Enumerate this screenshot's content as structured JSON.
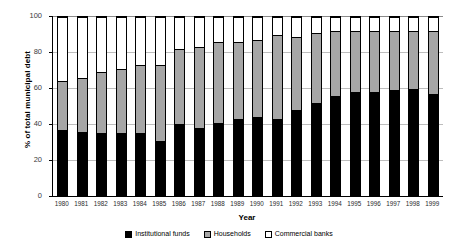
{
  "chart_data": {
    "type": "bar",
    "stacked": true,
    "title": "",
    "xlabel": "Year",
    "ylabel": "% of total municipal debt",
    "ylim": [
      0,
      100
    ],
    "yticks": [
      0,
      20,
      40,
      60,
      80,
      100
    ],
    "grid": true,
    "legend_position": "bottom",
    "categories": [
      "1980",
      "1981",
      "1982",
      "1983",
      "1984",
      "1985",
      "1986",
      "1987",
      "1988",
      "1989",
      "1990",
      "1991",
      "1992",
      "1993",
      "1994",
      "1995",
      "1996",
      "1997",
      "1998",
      "1999"
    ],
    "series": [
      {
        "name": "Institutional funds",
        "color": "#000000",
        "values": [
          37,
          36,
          35,
          35,
          35,
          31,
          40,
          38,
          41,
          43,
          44,
          43,
          48,
          52,
          56,
          58,
          58,
          59,
          60,
          57
        ]
      },
      {
        "name": "Households",
        "color": "#a6a6a6",
        "values": [
          27,
          30,
          34,
          36,
          38,
          42,
          42,
          45,
          45,
          43,
          43,
          47,
          41,
          39,
          36,
          34,
          34,
          33,
          32,
          35
        ]
      },
      {
        "name": "Commercial banks",
        "color": "#ffffff",
        "values": [
          36,
          34,
          31,
          29,
          27,
          27,
          18,
          17,
          14,
          14,
          13,
          10,
          11,
          9,
          8,
          8,
          8,
          8,
          8,
          8
        ]
      }
    ],
    "cumulative_tops": {
      "institutional": [
        37,
        36,
        35,
        35,
        35,
        31,
        40,
        38,
        41,
        43,
        44,
        43,
        48,
        52,
        56,
        58,
        58,
        59,
        60,
        57
      ],
      "households": [
        64,
        66,
        69,
        71,
        73,
        73,
        82,
        83,
        86,
        86,
        87,
        90,
        89,
        91,
        92,
        92,
        92,
        92,
        92,
        92
      ]
    }
  },
  "legend": {
    "items": [
      {
        "label": "Institutional funds",
        "swatch": "black-swatch-icon"
      },
      {
        "label": "Households",
        "swatch": "gray-swatch-icon"
      },
      {
        "label": "Commercial banks",
        "swatch": "white-swatch-icon"
      }
    ]
  }
}
